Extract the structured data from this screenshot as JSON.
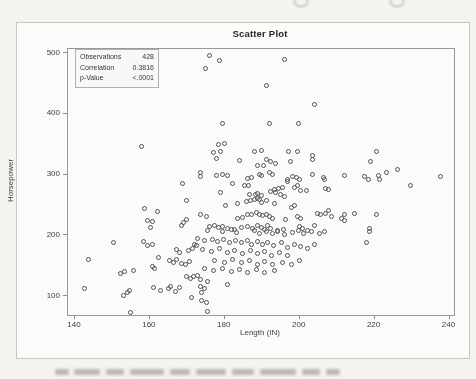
{
  "figure": {
    "title": "Scatter Plot",
    "stats_box": {
      "rows": [
        {
          "label": "Observations",
          "value": "428"
        },
        {
          "label": "Correlation",
          "value": "0.3816"
        },
        {
          "label": "p-Value",
          "value": "<.0001"
        }
      ]
    },
    "x_axis": {
      "label": "Length (IN)"
    },
    "y_axis": {
      "label": "Horsepower"
    }
  },
  "chart_data": {
    "type": "scatter",
    "title": "Scatter Plot",
    "xlabel": "Length (IN)",
    "ylabel": "Horsepower",
    "xlim": [
      138,
      242
    ],
    "ylim": [
      68,
      505
    ],
    "x_ticks": [
      140,
      160,
      180,
      200,
      220,
      240
    ],
    "y_ticks": [
      500,
      400,
      300,
      200,
      100
    ],
    "grid": false,
    "marker": {
      "shape": "open-circle",
      "color": "#515151",
      "size_px": 5
    },
    "stats": {
      "observations": 428,
      "correlation": 0.3816,
      "p_value": "<.0001"
    },
    "points": [
      [
        176.3,
        495
      ],
      [
        178.9,
        487
      ],
      [
        175,
        474
      ],
      [
        196.2,
        489
      ],
      [
        191.3,
        446
      ],
      [
        204.2,
        415
      ],
      [
        179.7,
        384
      ],
      [
        192.2,
        384
      ],
      [
        200,
        384
      ],
      [
        157.9,
        345
      ],
      [
        168.9,
        285
      ],
      [
        170,
        256
      ],
      [
        158.9,
        244
      ],
      [
        162.2,
        238
      ],
      [
        159.6,
        223
      ],
      [
        160.9,
        222
      ],
      [
        160.3,
        212
      ],
      [
        170,
        226
      ],
      [
        169.3,
        220
      ],
      [
        168.7,
        215
      ],
      [
        220.7,
        338
      ],
      [
        219.2,
        320
      ],
      [
        212.1,
        298
      ],
      [
        217.7,
        296
      ],
      [
        218.6,
        291
      ],
      [
        221.4,
        298
      ],
      [
        221.6,
        292
      ],
      [
        223.4,
        303
      ],
      [
        226.3,
        307
      ],
      [
        237.9,
        296
      ],
      [
        229.9,
        281
      ],
      [
        207.2,
        277
      ],
      [
        207.9,
        274
      ],
      [
        207.9,
        240
      ],
      [
        207.2,
        236
      ],
      [
        208.8,
        231
      ],
      [
        211.5,
        227
      ],
      [
        212.1,
        233
      ],
      [
        212.1,
        223
      ],
      [
        215,
        236
      ],
      [
        220.7,
        234
      ],
      [
        218.9,
        211
      ],
      [
        218.8,
        205
      ],
      [
        218.1,
        187
      ],
      [
        178.6,
        348
      ],
      [
        180.2,
        351
      ],
      [
        177.3,
        336
      ],
      [
        179.1,
        338
      ],
      [
        188.2,
        338
      ],
      [
        190,
        339
      ],
      [
        197.2,
        338
      ],
      [
        199.7,
        337
      ],
      [
        203.7,
        331
      ],
      [
        203.7,
        324
      ],
      [
        178,
        325
      ],
      [
        184.2,
        322
      ],
      [
        191.3,
        324
      ],
      [
        192.6,
        320
      ],
      [
        193.7,
        318
      ],
      [
        197.8,
        320
      ],
      [
        189.1,
        314
      ],
      [
        190.7,
        315
      ],
      [
        173.8,
        303
      ],
      [
        173.8,
        296
      ],
      [
        178,
        298
      ],
      [
        179.7,
        300
      ],
      [
        181.1,
        298
      ],
      [
        186.4,
        293
      ],
      [
        187.5,
        295
      ],
      [
        189.5,
        300
      ],
      [
        190.1,
        298
      ],
      [
        192.2,
        303
      ],
      [
        193.1,
        300
      ],
      [
        196.9,
        292
      ],
      [
        197.1,
        288
      ],
      [
        198.4,
        296
      ],
      [
        199.3,
        295
      ],
      [
        200.2,
        292
      ],
      [
        203.7,
        300
      ],
      [
        206.7,
        295
      ],
      [
        207,
        292
      ],
      [
        182.4,
        284
      ],
      [
        185.5,
        281
      ],
      [
        186.6,
        282
      ],
      [
        193.5,
        274
      ],
      [
        194.6,
        277
      ],
      [
        195.7,
        278
      ],
      [
        192.4,
        271
      ],
      [
        193.7,
        270
      ],
      [
        200.6,
        273
      ],
      [
        202.2,
        273
      ],
      [
        199.7,
        281
      ],
      [
        198.8,
        278
      ],
      [
        179.1,
        270
      ],
      [
        186.8,
        267
      ],
      [
        188.4,
        266
      ],
      [
        189.1,
        269
      ],
      [
        190.1,
        265
      ],
      [
        195.1,
        266
      ],
      [
        196.2,
        263
      ],
      [
        180.4,
        248
      ],
      [
        183.7,
        251
      ],
      [
        186,
        255
      ],
      [
        187.1,
        256
      ],
      [
        188.2,
        259
      ],
      [
        188.9,
        260
      ],
      [
        189.5,
        258
      ],
      [
        190,
        254
      ],
      [
        191.3,
        256
      ],
      [
        193.5,
        251
      ],
      [
        198.8,
        248
      ],
      [
        198.1,
        245
      ],
      [
        173.8,
        233
      ],
      [
        175.3,
        231
      ],
      [
        183.7,
        227
      ],
      [
        185.1,
        229
      ],
      [
        186.2,
        233
      ],
      [
        187.3,
        234
      ],
      [
        188.6,
        237
      ],
      [
        189.5,
        234
      ],
      [
        190.4,
        232
      ],
      [
        191.3,
        234
      ],
      [
        192.2,
        231
      ],
      [
        193.1,
        227
      ],
      [
        196.6,
        225
      ],
      [
        199.7,
        231
      ],
      [
        200.6,
        227
      ],
      [
        204.9,
        236
      ],
      [
        205.9,
        233
      ],
      [
        176.2,
        214
      ],
      [
        177.5,
        216
      ],
      [
        178.6,
        213
      ],
      [
        179.7,
        214
      ],
      [
        181.1,
        211
      ],
      [
        182.8,
        209
      ],
      [
        184.6,
        213
      ],
      [
        186.4,
        214
      ],
      [
        187.7,
        210
      ],
      [
        189.1,
        216
      ],
      [
        190,
        213
      ],
      [
        190.8,
        209
      ],
      [
        191.7,
        215
      ],
      [
        192.6,
        211
      ],
      [
        194.4,
        207
      ],
      [
        196,
        209
      ],
      [
        200.2,
        214
      ],
      [
        201.1,
        211
      ],
      [
        202.4,
        207
      ],
      [
        204.2,
        216
      ],
      [
        150.5,
        188
      ],
      [
        158.5,
        189
      ],
      [
        159.5,
        182
      ],
      [
        161,
        185
      ],
      [
        144,
        160
      ],
      [
        162.5,
        163
      ],
      [
        165.6,
        158
      ],
      [
        166.7,
        155
      ],
      [
        167.5,
        160
      ],
      [
        168.7,
        153
      ],
      [
        169.9,
        151
      ],
      [
        170.9,
        156
      ],
      [
        167.5,
        176
      ],
      [
        168.3,
        171
      ],
      [
        170.5,
        174
      ],
      [
        171.7,
        178
      ],
      [
        172.3,
        185
      ],
      [
        172.7,
        182
      ],
      [
        161,
        149
      ],
      [
        161.6,
        145
      ],
      [
        153.6,
        140
      ],
      [
        155.8,
        141
      ],
      [
        152.5,
        137
      ],
      [
        142.7,
        112
      ],
      [
        153.1,
        101
      ],
      [
        154.2,
        105
      ],
      [
        154.9,
        109
      ],
      [
        161.3,
        113
      ],
      [
        163.1,
        109
      ],
      [
        165.2,
        112
      ],
      [
        165.8,
        116
      ],
      [
        167.2,
        107
      ],
      [
        168.3,
        113
      ],
      [
        171.4,
        98
      ],
      [
        155,
        73
      ],
      [
        170.1,
        131
      ],
      [
        171.1,
        128
      ],
      [
        172,
        131
      ],
      [
        175.7,
        207
      ],
      [
        179.7,
        205
      ],
      [
        182,
        209
      ],
      [
        183.3,
        204
      ],
      [
        188.2,
        207
      ],
      [
        189.5,
        203
      ],
      [
        191.3,
        205
      ],
      [
        193.1,
        203
      ],
      [
        194.4,
        205
      ],
      [
        196.2,
        200
      ],
      [
        198.4,
        204
      ],
      [
        199.9,
        207
      ],
      [
        201.3,
        203
      ],
      [
        203.3,
        205
      ],
      [
        205.5,
        202
      ],
      [
        206.8,
        205
      ],
      [
        173.1,
        195
      ],
      [
        174.8,
        191
      ],
      [
        177.1,
        193
      ],
      [
        178.4,
        189
      ],
      [
        180,
        192
      ],
      [
        181.5,
        188
      ],
      [
        183,
        191
      ],
      [
        184.6,
        187
      ],
      [
        186.2,
        191
      ],
      [
        187.5,
        185
      ],
      [
        188.9,
        189
      ],
      [
        190.4,
        184
      ],
      [
        191.7,
        188
      ],
      [
        193.3,
        183
      ],
      [
        195.3,
        187
      ],
      [
        197.1,
        180
      ],
      [
        198.8,
        185
      ],
      [
        200.6,
        181
      ],
      [
        202.4,
        178
      ],
      [
        204.2,
        184
      ],
      [
        174.4,
        176
      ],
      [
        176.6,
        173
      ],
      [
        178.8,
        177
      ],
      [
        180.9,
        172
      ],
      [
        182.8,
        174
      ],
      [
        185.1,
        170
      ],
      [
        187.1,
        174
      ],
      [
        189.1,
        169
      ],
      [
        190.8,
        173
      ],
      [
        192.8,
        167
      ],
      [
        194.9,
        172
      ],
      [
        196.9,
        166
      ],
      [
        177.5,
        158
      ],
      [
        180.2,
        155
      ],
      [
        182.4,
        160
      ],
      [
        184.6,
        154
      ],
      [
        186.9,
        158
      ],
      [
        188.9,
        152
      ],
      [
        190.8,
        156
      ],
      [
        193.1,
        151
      ],
      [
        195.7,
        155
      ],
      [
        198.1,
        151
      ],
      [
        200.2,
        158
      ],
      [
        174.8,
        145
      ],
      [
        177.3,
        142
      ],
      [
        179.7,
        145
      ],
      [
        182,
        140
      ],
      [
        184.2,
        144
      ],
      [
        186.4,
        139
      ],
      [
        188.6,
        143
      ],
      [
        190.8,
        138
      ],
      [
        193.5,
        142
      ],
      [
        173.1,
        133
      ],
      [
        173.8,
        127
      ],
      [
        175.7,
        123
      ],
      [
        173.8,
        116
      ],
      [
        174.9,
        112
      ],
      [
        174.1,
        106
      ],
      [
        181.1,
        118
      ],
      [
        174.1,
        92
      ],
      [
        175.3,
        89
      ],
      [
        175.7,
        74
      ]
    ]
  }
}
